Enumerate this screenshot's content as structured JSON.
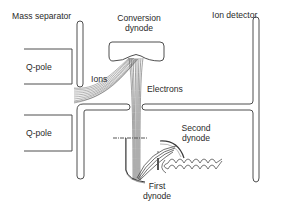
{
  "diagram": {
    "labels": {
      "mass_separator": "Mass separator",
      "conversion_dynode_line1": "Conversion",
      "conversion_dynode_line2": "dynode",
      "ion_detector": "Ion detector",
      "qpole_top": "Q-pole",
      "qpole_bottom": "Q-pole",
      "ions": "Ions",
      "electrons": "Electrons",
      "second_dynode_line1": "Second",
      "second_dynode_line2": "dynode",
      "first_dynode_line1": "First",
      "first_dynode_line2": "dynode"
    },
    "colors": {
      "line": "#3a3a3a",
      "fill": "#ffffff",
      "beam": "#555555"
    }
  }
}
